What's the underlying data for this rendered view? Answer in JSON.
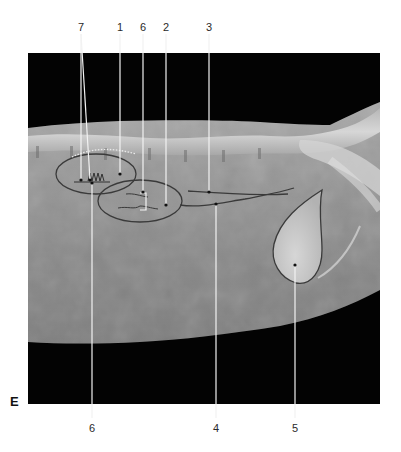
{
  "figure": {
    "panel_letter": "E",
    "view": "lateral abdominal radiograph",
    "top_labels": [
      {
        "text": "7",
        "x": 81
      },
      {
        "text": "1",
        "x": 120
      },
      {
        "text": "6",
        "x": 143
      },
      {
        "text": "2",
        "x": 166
      },
      {
        "text": "3",
        "x": 209
      }
    ],
    "bottom_labels": [
      {
        "text": "6",
        "x": 92
      },
      {
        "text": "4",
        "x": 216
      },
      {
        "text": "5",
        "x": 295
      }
    ],
    "colors": {
      "background": "#ffffff",
      "film_black": "#030303",
      "soft_tissue": "#8c8c8c",
      "bone": "#d8d8d8",
      "outline": "#3a3a3a",
      "leader": "#f2f2f2"
    }
  }
}
